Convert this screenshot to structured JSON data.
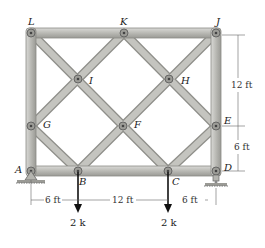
{
  "diagram": {
    "type": "truss",
    "joints": {
      "L": {
        "label": "L",
        "x": 31,
        "y": 33
      },
      "K": {
        "label": "K",
        "x": 124,
        "y": 33
      },
      "J": {
        "label": "J",
        "x": 216,
        "y": 33
      },
      "I": {
        "label": "I",
        "x": 78,
        "y": 79
      },
      "H": {
        "label": "H",
        "x": 169,
        "y": 79
      },
      "G": {
        "label": "G",
        "x": 31,
        "y": 126
      },
      "F": {
        "label": "F",
        "x": 123,
        "y": 126
      },
      "E": {
        "label": "E",
        "x": 216,
        "y": 126
      },
      "A": {
        "label": "A",
        "x": 31,
        "y": 171
      },
      "B": {
        "label": "B",
        "x": 78,
        "y": 171
      },
      "C": {
        "label": "C",
        "x": 168,
        "y": 171
      },
      "D": {
        "label": "D",
        "x": 216,
        "y": 171
      }
    },
    "members": [
      "LK",
      "KJ",
      "LG",
      "GA",
      "JE",
      "ED",
      "AB",
      "BC",
      "CD",
      "LI",
      "IF",
      "FC",
      "KI",
      "IG",
      "KH",
      "HE",
      "JH",
      "HF",
      "FB",
      "GB",
      "EC"
    ],
    "supports": {
      "A": "pin",
      "D": "roller"
    },
    "loads": [
      {
        "joint": "B",
        "label": "2 k"
      },
      {
        "joint": "C",
        "label": "2 k"
      }
    ],
    "dimensions": {
      "horizontal": [
        "6 ft",
        "12 ft",
        "6 ft"
      ],
      "vertical": [
        "12 ft",
        "6 ft"
      ]
    }
  }
}
